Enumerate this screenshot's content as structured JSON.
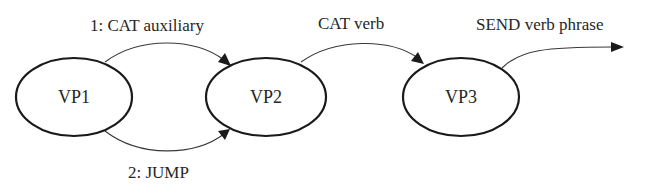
{
  "diagram": {
    "type": "state-transition-network",
    "nodes": [
      {
        "id": "VP1",
        "label": "VP1"
      },
      {
        "id": "VP2",
        "label": "VP2"
      },
      {
        "id": "VP3",
        "label": "VP3"
      }
    ],
    "edges": [
      {
        "from": "VP1",
        "to": "VP2",
        "label": "1: CAT auxiliary"
      },
      {
        "from": "VP1",
        "to": "VP2",
        "label": "2: JUMP"
      },
      {
        "from": "VP2",
        "to": "VP3",
        "label": "CAT verb"
      },
      {
        "from": "VP3",
        "to": null,
        "label": "SEND verb phrase"
      }
    ]
  },
  "colors": {
    "background": "#ffffff",
    "stroke": "#1a1a1a",
    "text": "#262626"
  }
}
